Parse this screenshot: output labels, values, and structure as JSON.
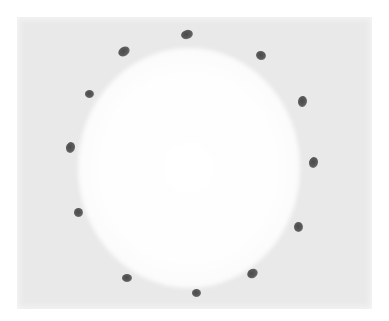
{
  "image": {
    "description": "Photograph of twelve dark seeds arranged in a circle on a light gray surface with a bright white circular center",
    "colors": {
      "background": "#e9e9e9",
      "center": "#ffffff",
      "seed": "#4f4f4f"
    },
    "seeds": [
      {
        "x": 187,
        "y": 34,
        "w": 12,
        "h": 9,
        "rot": -15
      },
      {
        "x": 124,
        "y": 51,
        "w": 12,
        "h": 9,
        "rot": -30
      },
      {
        "x": 261,
        "y": 55,
        "w": 10,
        "h": 9,
        "rot": 20
      },
      {
        "x": 89,
        "y": 94,
        "w": 9,
        "h": 8,
        "rot": 0
      },
      {
        "x": 302,
        "y": 101,
        "w": 9,
        "h": 11,
        "rot": 10
      },
      {
        "x": 70,
        "y": 147,
        "w": 9,
        "h": 11,
        "rot": 15
      },
      {
        "x": 313,
        "y": 162,
        "w": 9,
        "h": 11,
        "rot": 15
      },
      {
        "x": 78,
        "y": 212,
        "w": 9,
        "h": 9,
        "rot": 0
      },
      {
        "x": 298,
        "y": 227,
        "w": 9,
        "h": 10,
        "rot": 0
      },
      {
        "x": 252,
        "y": 273,
        "w": 11,
        "h": 9,
        "rot": -30
      },
      {
        "x": 127,
        "y": 278,
        "w": 10,
        "h": 8,
        "rot": 0
      },
      {
        "x": 196,
        "y": 293,
        "w": 9,
        "h": 8,
        "rot": 0
      }
    ]
  }
}
